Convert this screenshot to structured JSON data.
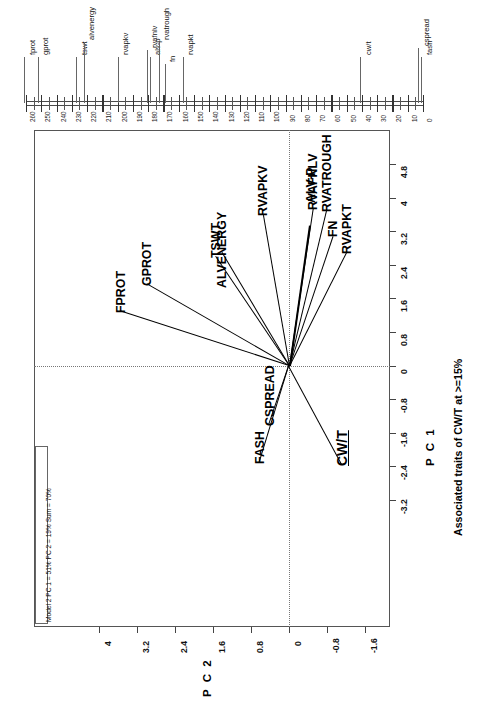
{
  "figure": {
    "annotation": "Model 2 PC 1 = 51% PC 2 = 19% Sum = 70%",
    "caption": "Associated traits of CW/T at >=15%",
    "x_axis_title": "P C 1",
    "y_axis_title": "P C 2"
  },
  "chart_data": {
    "type": "scatter",
    "title": "Associated traits of CW/T at >=15%",
    "subtitle": "Model 2 PC 1 = 51% PC 2 = 19% Sum = 70%",
    "xlabel": "P C 1",
    "ylabel": "P C 2",
    "xlim": [
      -3.2,
      4.8
    ],
    "ylim": [
      -1.6,
      4.0
    ],
    "xticks": [
      "-3.2",
      "-2.4",
      "-1.6",
      "-0.8",
      "0",
      "0.8",
      "1.6",
      "2.4",
      "3.2",
      "4",
      "4.8"
    ],
    "yticks": [
      "-1.6",
      "-0.8",
      "0",
      "0.8",
      "1.6",
      "2.4",
      "3.2",
      "4"
    ],
    "grid": false,
    "legend": "none",
    "variance_explained": {
      "pc1": "51%",
      "pc2": "19%",
      "sum": "70%"
    },
    "vectors": [
      {
        "label": "FPROT",
        "pc1": 1.3,
        "pc2": 3.55
      },
      {
        "label": "GPROT",
        "pc1": 1.95,
        "pc2": 3.0
      },
      {
        "label": "TSWT",
        "pc1": 2.6,
        "pc2": 1.55
      },
      {
        "label": "ALVENERGY",
        "pc1": 2.7,
        "pc2": 1.42
      },
      {
        "label": "RVAPKV",
        "pc1": 3.6,
        "pc2": 0.55
      },
      {
        "label": "ALV-P",
        "pc1": 3.35,
        "pc2": -0.42
      },
      {
        "label": "RVAFNLV",
        "pc1": 3.75,
        "pc2": -0.5
      },
      {
        "label": "RVATROUGH",
        "pc1": 3.7,
        "pc2": -0.78
      },
      {
        "label": "FN",
        "pc1": 3.1,
        "pc2": -0.92
      },
      {
        "label": "RVAPKT",
        "pc1": 2.7,
        "pc2": -1.2
      },
      {
        "label": "CSPREAD",
        "pc1": -1.4,
        "pc2": 0.42
      },
      {
        "label": "FASH",
        "pc1": -2.3,
        "pc2": 0.62
      },
      {
        "label": "CW/T",
        "pc1": -2.35,
        "pc2": -1.12
      }
    ]
  },
  "ruler": {
    "ticks": [
      "260",
      "250",
      "240",
      "230",
      "220",
      "210",
      "200",
      "190",
      "180",
      "170",
      "160",
      "150",
      "140",
      "130",
      "120",
      "110",
      "100",
      "90",
      "80",
      "70",
      "60",
      "50",
      "40",
      "30",
      "20",
      "10",
      "0"
    ],
    "markers": [
      {
        "label": "fprot",
        "value": 261
      },
      {
        "label": "gprot",
        "value": 252
      },
      {
        "label": "tswt",
        "value": 227
      },
      {
        "label": "alvenergy",
        "value": 222
      },
      {
        "label": "rvapkv",
        "value": 200
      },
      {
        "label": "rvafnlv",
        "value": 181
      },
      {
        "label": "alv-p",
        "value": 179
      },
      {
        "label": "rvatrough",
        "value": 173
      },
      {
        "label": "fn",
        "value": 169
      },
      {
        "label": "rvapkt",
        "value": 157
      },
      {
        "label": "cw/t",
        "value": 41
      },
      {
        "label": "cspread",
        "value": 3
      },
      {
        "label": "fash",
        "value": 1
      }
    ]
  }
}
